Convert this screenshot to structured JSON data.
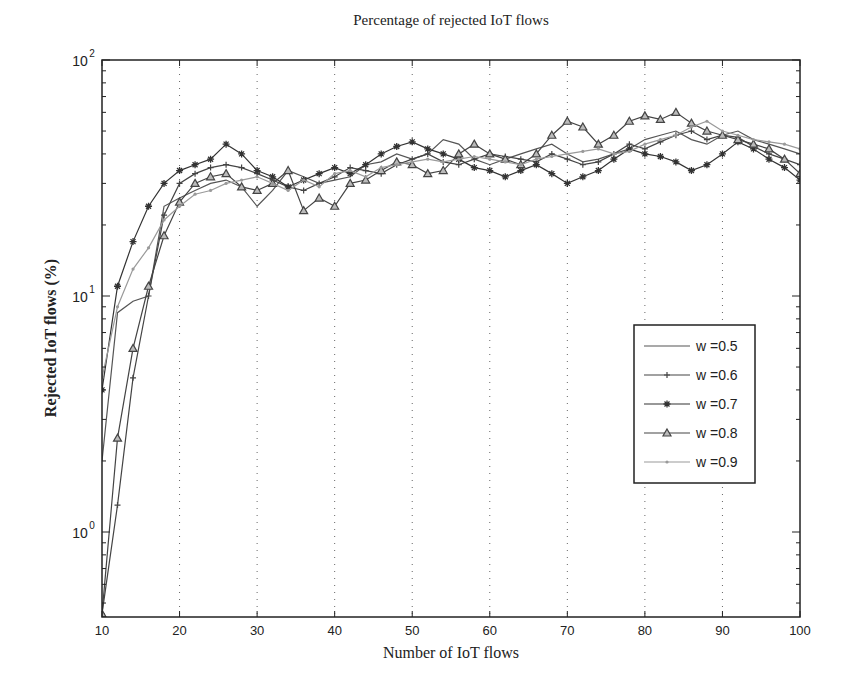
{
  "figure": {
    "background_bleed": {
      "right_text_fragment": "Conclusion",
      "caption_fragment": "Fig. 1. Bandwidth requests (ms)"
    }
  },
  "chart_data": {
    "type": "line",
    "title": "Percentage of rejected IoT flows",
    "xlabel": "Number of IoT flows",
    "ylabel": "Rejected IoT flows (%)",
    "xlim": [
      10,
      100
    ],
    "ylim": [
      0.45,
      100
    ],
    "yscale": "log",
    "x_ticks": [
      10,
      20,
      30,
      40,
      50,
      60,
      70,
      80,
      90,
      100
    ],
    "y_ticks": [
      {
        "value": 1,
        "label": "10^0"
      },
      {
        "value": 10,
        "label": "10^1"
      },
      {
        "value": 100,
        "label": "10^2"
      }
    ],
    "grid": "x-dotted",
    "legend_position": "right-center",
    "x": [
      10,
      12,
      14,
      16,
      18,
      20,
      22,
      24,
      26,
      28,
      30,
      32,
      34,
      36,
      38,
      40,
      42,
      44,
      46,
      48,
      50,
      52,
      54,
      56,
      58,
      60,
      62,
      64,
      66,
      68,
      70,
      72,
      74,
      76,
      78,
      80,
      82,
      84,
      86,
      88,
      90,
      92,
      94,
      96,
      98,
      100
    ],
    "series": [
      {
        "name": "w =0.5",
        "marker": "none",
        "color": "#555555",
        "values": [
          2.0,
          8.5,
          9.5,
          10,
          24,
          26,
          28,
          30,
          31,
          29,
          24,
          28,
          34,
          32,
          30,
          31,
          32,
          36,
          37,
          40,
          38,
          40,
          46,
          44,
          38,
          36,
          38,
          40,
          42,
          44,
          40,
          37,
          38,
          40,
          42,
          46,
          48,
          50,
          46,
          44,
          48,
          50,
          46,
          44,
          42,
          40
        ]
      },
      {
        "name": "w =0.6",
        "marker": "plus",
        "color": "#444444",
        "values": [
          0.45,
          1.3,
          4.5,
          10,
          22,
          30,
          33,
          35,
          36,
          35,
          33,
          31,
          29,
          28,
          30,
          32,
          35,
          34,
          33,
          36,
          38,
          40,
          37,
          36,
          38,
          40,
          39,
          38,
          37,
          40,
          38,
          36,
          37,
          40,
          44,
          42,
          45,
          48,
          50,
          46,
          48,
          47,
          43,
          40,
          38,
          36
        ]
      },
      {
        "name": "w =0.7",
        "marker": "star",
        "color": "#333333",
        "values": [
          4.0,
          11,
          17,
          24,
          30,
          34,
          36,
          38,
          44,
          40,
          34,
          32,
          29,
          31,
          33,
          35,
          33,
          36,
          40,
          43,
          45,
          42,
          40,
          38,
          35,
          34,
          32,
          34,
          36,
          33,
          30,
          32,
          34,
          38,
          42,
          40,
          39,
          37,
          34,
          36,
          40,
          45,
          42,
          38,
          35,
          31
        ]
      },
      {
        "name": "w =0.8",
        "marker": "triangle",
        "color": "#444444",
        "values": [
          0.45,
          2.5,
          6,
          11,
          18,
          25,
          30,
          32,
          33,
          29,
          28,
          30,
          34,
          23,
          26,
          24,
          30,
          31,
          34,
          37,
          36,
          33,
          34,
          40,
          44,
          40,
          38,
          36,
          40,
          48,
          55,
          52,
          44,
          48,
          55,
          58,
          56,
          60,
          54,
          50,
          48,
          46,
          44,
          42,
          38,
          33
        ]
      },
      {
        "name": "w =0.9",
        "marker": "dot",
        "color": "#9a9a9a",
        "values": [
          4.5,
          9,
          13,
          16,
          21,
          24,
          27,
          28,
          30,
          31,
          32,
          30,
          28,
          31,
          29,
          33,
          34,
          32,
          35,
          36,
          37,
          38,
          37,
          38,
          39,
          38,
          37,
          36,
          38,
          39,
          40,
          41,
          42,
          40,
          41,
          44,
          46,
          48,
          52,
          55,
          50,
          48,
          46,
          45,
          44,
          42
        ]
      }
    ]
  }
}
